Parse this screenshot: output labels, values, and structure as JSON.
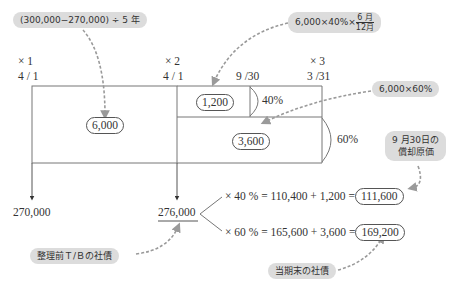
{
  "timeline": {
    "x1": {
      "label": "× 1",
      "date": "4 / 1"
    },
    "x2": {
      "label": "× 2",
      "date": "4 / 1"
    },
    "mid": {
      "date": "9 /30"
    },
    "x3": {
      "label": "× 3",
      "date": "3 /31"
    }
  },
  "callouts": {
    "annual_amort": "(300,000−270,000) ÷ 5 年",
    "half_year": {
      "prefix": "6,000×40%×",
      "frac_num": "6 月",
      "frac_den": "12月"
    },
    "sixty_pct": "6,000×60%",
    "amortized_cost_line1": "9 月30日の",
    "amortized_cost_line2": "償却原価",
    "pre_tb": "整理前Ｔ/Ｂの社債",
    "period_end": "当期末の社債"
  },
  "values": {
    "annual": "6,000",
    "half_year_amount": "1,200",
    "sixty_amount": "3,600",
    "pct40": "40%",
    "pct60": "60%",
    "start_value": "270,000",
    "x2_value": "276,000",
    "eq40_prefix": "× 40 % = 110,400 + 1,200 =",
    "eq40_result": "111,600",
    "eq60_prefix": "× 60 % = 165,600 + 3,600 =",
    "eq60_result": "169,200"
  },
  "colors": {
    "bubble": "#dcdcdc",
    "line": "#666666",
    "dashed_arrow": "#9a9a9a"
  }
}
